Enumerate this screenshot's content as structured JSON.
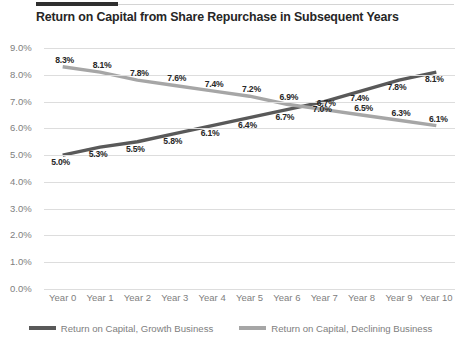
{
  "header": {
    "title": "Return on Capital from Share Repurchase in Subsequent Years"
  },
  "colors": {
    "growth_line": "#595959",
    "declining_line": "#a6a6a6",
    "gridline": "#dddddd",
    "tick_text": "#808080",
    "label_text": "#262626",
    "rule_accent": "#2f2f2f"
  },
  "legend": {
    "position": "bottom-center",
    "items": [
      {
        "label": "Return on Capital, Growth Business",
        "color": "#595959",
        "icon": "line-swatch-icon"
      },
      {
        "label": "Return on Capital, Declining Business",
        "color": "#a6a6a6",
        "icon": "line-swatch-icon"
      }
    ]
  },
  "axes": {
    "y_ticks": [
      "0.0%",
      "1.0%",
      "2.0%",
      "3.0%",
      "4.0%",
      "5.0%",
      "6.0%",
      "7.0%",
      "8.0%",
      "9.0%"
    ],
    "x_ticks": [
      "Year 0",
      "Year 1",
      "Year 2",
      "Year 3",
      "Year 4",
      "Year 5",
      "Year 6",
      "Year 7",
      "Year 8",
      "Year 9",
      "Year 10"
    ]
  },
  "chart_data": {
    "type": "line",
    "title": "Return on Capital from Share Repurchase in Subsequent Years",
    "xlabel": "",
    "ylabel": "",
    "categories": [
      "Year 0",
      "Year 1",
      "Year 2",
      "Year 3",
      "Year 4",
      "Year 5",
      "Year 6",
      "Year 7",
      "Year 8",
      "Year 9",
      "Year 10"
    ],
    "ylim": [
      0.0,
      9.0
    ],
    "ytick_step": 1.0,
    "yaxis_format": "percent_one_decimal",
    "grid": true,
    "legend_position": "bottom-center",
    "data_labels": true,
    "series": [
      {
        "name": "Return on Capital, Growth Business",
        "color": "#595959",
        "values": [
          5.0,
          5.3,
          5.5,
          5.8,
          6.1,
          6.4,
          6.7,
          7.0,
          7.4,
          7.8,
          8.1
        ],
        "labels": [
          "5.0%",
          "5.3%",
          "5.5%",
          "5.8%",
          "6.1%",
          "6.4%",
          "6.7%",
          "7.0%",
          "7.4%",
          "7.8%",
          "8.1%"
        ]
      },
      {
        "name": "Return on Capital, Declining Business",
        "color": "#a6a6a6",
        "values": [
          8.3,
          8.1,
          7.8,
          7.6,
          7.4,
          7.2,
          6.9,
          6.7,
          6.5,
          6.3,
          6.1
        ],
        "labels": [
          "8.3%",
          "8.1%",
          "7.8%",
          "7.6%",
          "7.4%",
          "7.2%",
          "6.9%",
          "6.7%",
          "6.5%",
          "6.3%",
          "6.1%"
        ]
      }
    ]
  }
}
